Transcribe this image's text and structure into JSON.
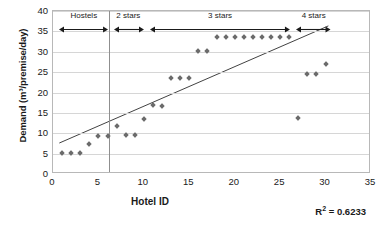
{
  "chart_data": {
    "type": "scatter",
    "title": "",
    "xlabel": "Hotel ID",
    "ylabel": "Demand (m³/premise/day)",
    "xlim": [
      0,
      35
    ],
    "ylim": [
      0,
      40
    ],
    "xticks": [
      0,
      5,
      10,
      15,
      20,
      25,
      30,
      35
    ],
    "yticks": [
      0,
      5,
      10,
      15,
      20,
      25,
      30,
      35,
      40
    ],
    "grid": "horizontal",
    "legend": "none",
    "series": [
      {
        "name": "Demand per hotel",
        "marker": "diamond",
        "color": "#6b6b6b",
        "points": [
          [
            1,
            5.2
          ],
          [
            2,
            5.2
          ],
          [
            3,
            5.2
          ],
          [
            4,
            7.3
          ],
          [
            5,
            9.3
          ],
          [
            6,
            9.3
          ],
          [
            7,
            11.8
          ],
          [
            8,
            9.5
          ],
          [
            9,
            9.5
          ],
          [
            10,
            13.5
          ],
          [
            11,
            17.0
          ],
          [
            12,
            16.8
          ],
          [
            13,
            23.5
          ],
          [
            14,
            23.5
          ],
          [
            15,
            23.5
          ],
          [
            16,
            30.2
          ],
          [
            17,
            30.2
          ],
          [
            18,
            33.5
          ],
          [
            19,
            33.5
          ],
          [
            20,
            33.5
          ],
          [
            21,
            33.5
          ],
          [
            22,
            33.5
          ],
          [
            23,
            33.5
          ],
          [
            24,
            33.5
          ],
          [
            25,
            33.5
          ],
          [
            26,
            33.5
          ],
          [
            27,
            13.7
          ],
          [
            28,
            24.5
          ],
          [
            29,
            24.5
          ],
          [
            30,
            27.0
          ]
        ]
      }
    ],
    "trendline": {
      "type": "linear",
      "x_start": 0.7,
      "y_start": 7.2,
      "x_end": 30.5,
      "y_end": 36.3,
      "color": "#404040"
    },
    "divider_lines": [
      {
        "x": 6.2,
        "color": "#8f8f8f"
      }
    ],
    "annotations": [
      {
        "label": "Hostels",
        "x_start": 0.8,
        "x_end": 6.2,
        "label_x": 3.5
      },
      {
        "label": "2 stars",
        "x_start": 6.8,
        "x_end": 10.1,
        "label_x": 8.4
      },
      {
        "label": "3 stars",
        "x_start": 10.8,
        "x_end": 26.2,
        "label_x": 18.5
      },
      {
        "label": "4 stars",
        "x_start": 26.9,
        "x_end": 30.7,
        "label_x": 28.8
      }
    ],
    "r2_prefix": "R",
    "r2_sup": "2",
    "r2_value": " = 0.6233"
  }
}
